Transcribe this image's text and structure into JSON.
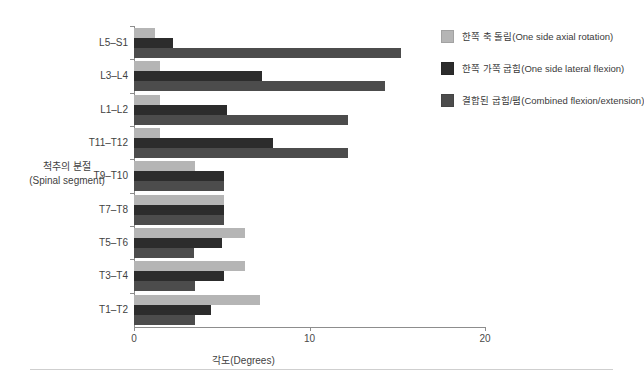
{
  "chart_data": {
    "type": "bar",
    "orientation": "horizontal",
    "title": "",
    "xlabel": "각도(Degrees)",
    "ylabel_line1": "척추의 분절",
    "ylabel_line2": "(Spinal segment)",
    "xlim": [
      0,
      20
    ],
    "xticks": [
      0,
      10,
      20
    ],
    "xtick_labels": [
      "0",
      "10",
      "20"
    ],
    "grid": false,
    "legend_position": "right",
    "categories": [
      "L5–S1",
      "L3–L4",
      "L1–L2",
      "T11–T12",
      "T9–T10",
      "T7–T8",
      "T5–T6",
      "T3–T4",
      "T1–T2"
    ],
    "series": [
      {
        "name": "한쪽 축 돌림(One side axial rotation)",
        "color": "#b5b5b5",
        "values": [
          1.2,
          1.5,
          1.5,
          1.5,
          3.5,
          5.1,
          6.3,
          6.3,
          7.2
        ]
      },
      {
        "name": "한쪽 가쪽 굽힘(One side lateral flexion)",
        "color": "#2c2c2c",
        "values": [
          2.2,
          7.3,
          5.3,
          7.9,
          5.1,
          5.1,
          5.0,
          5.1,
          4.4
        ]
      },
      {
        "name": "결합된 굽힘/폄(Combined flexion/extension)",
        "color": "#4c4c4c",
        "values": [
          15.2,
          14.3,
          12.2,
          12.2,
          5.1,
          5.1,
          3.4,
          3.5,
          3.5
        ]
      }
    ]
  },
  "legend": {
    "items": [
      {
        "label": "한쪽 축 돌림(One side axial rotation)",
        "color": "#b5b5b5"
      },
      {
        "label": "한쪽 가쪽 굽힘(One side lateral flexion)",
        "color": "#2c2c2c"
      },
      {
        "label": "결합된 굽힘/폄(Combined flexion/extension)",
        "color": "#4c4c4c"
      }
    ]
  },
  "axes": {
    "x_title": "각도(Degrees)",
    "y_title_line1": "척추의 분절",
    "y_title_line2": "(Spinal segment)",
    "x_tick_0": "0",
    "x_tick_10": "10",
    "x_tick_20": "20"
  }
}
